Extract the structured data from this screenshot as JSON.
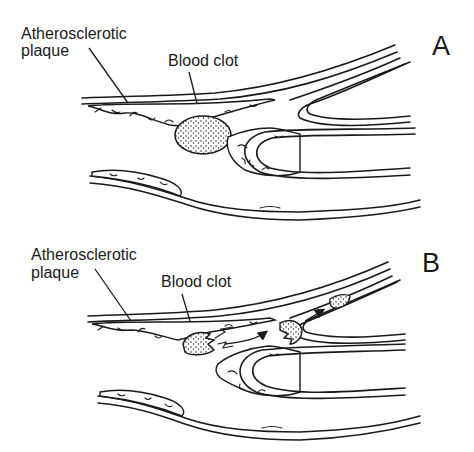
{
  "figure": {
    "type": "medical-illustration"
  },
  "panels": [
    {
      "letter": "A",
      "labels": {
        "plaque_line1": "Atherosclerotic",
        "plaque_line2": "plaque",
        "clot": "Blood clot"
      }
    },
    {
      "letter": "B",
      "labels": {
        "plaque_line1": "Atherosclerotic",
        "plaque_line2": "plaque",
        "clot": "Blood clot"
      }
    }
  ],
  "colors": {
    "ink": "#1a1a1a",
    "background": "#ffffff"
  }
}
